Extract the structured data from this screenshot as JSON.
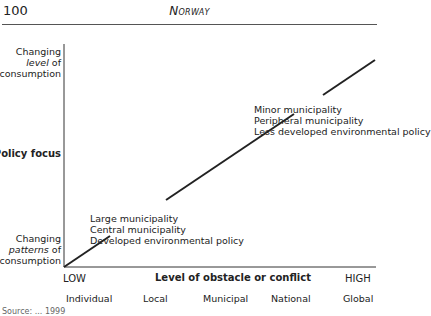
{
  "header": {
    "page_number": "100",
    "running_head": "Norway"
  },
  "diagram": {
    "y_axis": {
      "top_label": {
        "line1": "Changing",
        "line2_italic": "level",
        "line2_rest": " of",
        "line3": "consumption"
      },
      "title": "Policy focus",
      "bottom_label": {
        "line1": "Changing",
        "line2_italic": "patterns",
        "line2_rest": " of",
        "line3": "consumption"
      }
    },
    "x_axis": {
      "low": "LOW",
      "title": "Level of obstacle or conflict",
      "high": "HIGH",
      "categories": [
        "Individual",
        "Local",
        "Municipal",
        "National",
        "Global"
      ]
    },
    "upper_note": [
      "Minor municipality",
      "Peripheral municipality",
      "Less developed environmental policy"
    ],
    "lower_note": [
      "Large municipality",
      "Central municipality",
      "Developed environmental policy"
    ],
    "line": {
      "from": [
        64,
        267
      ],
      "to": [
        375,
        60
      ],
      "color": "#222222"
    }
  },
  "footer": {
    "source_partial": "Source: ... 1999"
  }
}
